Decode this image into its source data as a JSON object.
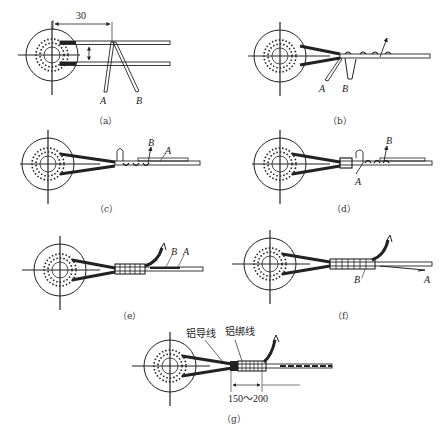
{
  "figure": {
    "panels": [
      {
        "id": "a",
        "caption": "（a）",
        "labels": {
          "A": "A",
          "B": "B"
        },
        "dimension": "30"
      },
      {
        "id": "b",
        "caption": "（b）",
        "labels": {
          "A": "A",
          "B": "B"
        }
      },
      {
        "id": "c",
        "caption": "（c）",
        "labels": {
          "A": "A",
          "B": "B"
        }
      },
      {
        "id": "d",
        "caption": "（d）",
        "labels": {
          "A": "A",
          "B": "B"
        }
      },
      {
        "id": "e",
        "caption": "（e）",
        "labels": {
          "A": "A",
          "B": "B"
        }
      },
      {
        "id": "f",
        "caption": "（f）",
        "labels": {
          "A": "A",
          "B": "B"
        }
      },
      {
        "id": "g",
        "caption": "（g）",
        "labels": {
          "conductor": "铝导线",
          "binding": "铝绑线"
        },
        "dimension": "150～200"
      }
    ],
    "colors": {
      "line": "#222222",
      "background": "#ffffff"
    }
  }
}
